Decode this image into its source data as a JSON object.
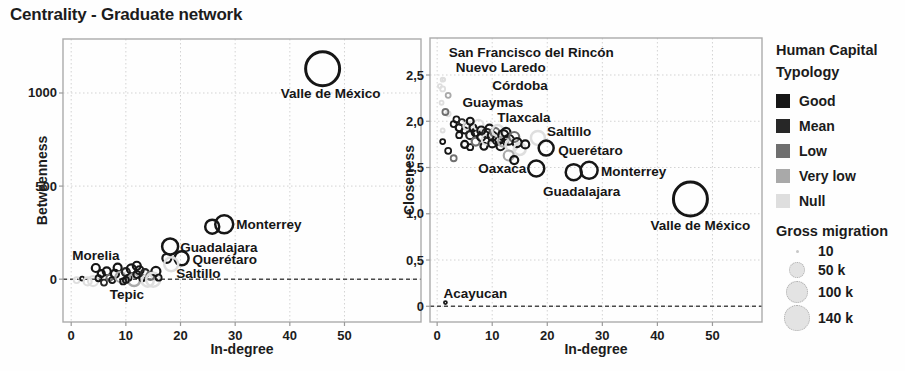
{
  "title": "Centrality - Graduate network",
  "legend": {
    "typology": {
      "title": "Human Capital Typology",
      "items": [
        {
          "label": "Good",
          "color": "#161616"
        },
        {
          "label": "Mean",
          "color": "#272727"
        },
        {
          "label": "Low",
          "color": "#6f6f6f"
        },
        {
          "label": "Very low",
          "color": "#a9a9a9"
        },
        {
          "label": "Null",
          "color": "#dedede"
        }
      ]
    },
    "size": {
      "title": "Gross migration",
      "items": [
        {
          "label": "10",
          "r": 1.5
        },
        {
          "label": "50 k",
          "r": 8
        },
        {
          "label": "100 k",
          "r": 11
        },
        {
          "label": "140 k",
          "r": 13
        }
      ]
    }
  },
  "chart_data": [
    {
      "type": "scatter",
      "xlabel": "In-degree",
      "ylabel": "Betweenness",
      "xlim": [
        -1.5,
        64
      ],
      "ylim": [
        -230,
        1290
      ],
      "xticks": [
        {
          "v": 0,
          "label": "0"
        },
        {
          "v": 10,
          "label": "10"
        },
        {
          "v": 20,
          "label": "20"
        },
        {
          "v": 30,
          "label": "30"
        },
        {
          "v": 40,
          "label": "40"
        },
        {
          "v": 50,
          "label": "50"
        }
      ],
      "yticks": [
        {
          "v": 0,
          "label": "0"
        },
        {
          "v": 500,
          "label": "500"
        },
        {
          "v": 1000,
          "label": "1000"
        }
      ],
      "zero_line_y": 0,
      "labeled_points": [
        {
          "city": "Valle de México",
          "x": 46,
          "y": 1130,
          "t": 0,
          "r": 17,
          "dx": 8,
          "dy": 25,
          "anchor": "middle"
        },
        {
          "city": "Monterrey",
          "x": 28,
          "y": 295,
          "t": 0,
          "r": 9,
          "dx": 12,
          "dy": 0,
          "anchor": "start"
        },
        {
          "city": "Guadalajara",
          "x": 18.1,
          "y": 176,
          "t": 0,
          "r": 8,
          "dx": 10,
          "dy": 1,
          "anchor": "start"
        },
        {
          "city": "Querétaro",
          "x": 20.2,
          "y": 112,
          "t": 0,
          "r": 7,
          "dx": 11,
          "dy": 1,
          "anchor": "start"
        },
        {
          "city": "Saltillo",
          "x": 18.3,
          "y": 80,
          "t": 4,
          "r": 7,
          "dx": 5,
          "dy": 9,
          "anchor": "start"
        },
        {
          "city": "Morelia",
          "x": 4.5,
          "y": 60,
          "t": 0,
          "r": 4,
          "dx": 0,
          "dy": -13,
          "anchor": "middle"
        },
        {
          "city": "Tepic",
          "x": 10,
          "y": -4,
          "t": 0,
          "r": 3,
          "dx": 1,
          "dy": 15,
          "anchor": "middle"
        }
      ],
      "points": [
        [
          25.8,
          282,
          0,
          7
        ],
        [
          17.5,
          112,
          0,
          4.5
        ],
        [
          1,
          -5,
          4,
          3
        ],
        [
          2,
          3,
          0,
          2
        ],
        [
          3,
          -12,
          4,
          4
        ],
        [
          4,
          -10,
          4,
          5
        ],
        [
          5,
          5,
          0,
          3
        ],
        [
          5.5,
          30,
          0,
          3.5
        ],
        [
          6,
          -18,
          1,
          3
        ],
        [
          6.5,
          42,
          0,
          4
        ],
        [
          7,
          8,
          2,
          3
        ],
        [
          7.5,
          -5,
          0,
          3
        ],
        [
          8,
          28,
          0,
          4
        ],
        [
          8.5,
          62,
          0,
          4
        ],
        [
          9,
          12,
          3,
          5
        ],
        [
          9.5,
          -12,
          0,
          3
        ],
        [
          10,
          38,
          1,
          4
        ],
        [
          10.5,
          8,
          0,
          3
        ],
        [
          11,
          55,
          0,
          4.5
        ],
        [
          11.5,
          -5,
          3,
          6
        ],
        [
          12,
          25,
          0,
          3.5
        ],
        [
          12.5,
          48,
          0,
          4
        ],
        [
          13,
          5,
          0,
          3
        ],
        [
          13.5,
          32,
          1,
          4
        ],
        [
          14,
          -8,
          4,
          6
        ],
        [
          14.5,
          18,
          2,
          4
        ],
        [
          15.5,
          42,
          0,
          4.5
        ],
        [
          15,
          -3,
          4,
          7
        ],
        [
          16,
          8,
          0,
          3
        ],
        [
          12,
          72,
          0,
          4
        ]
      ]
    },
    {
      "type": "scatter",
      "xlabel": "In-degree",
      "ylabel": "Closeness",
      "xlim": [
        -1.3,
        59
      ],
      "ylim": [
        -0.17,
        2.9
      ],
      "xticks": [
        {
          "v": 0,
          "label": "0"
        },
        {
          "v": 10,
          "label": "10"
        },
        {
          "v": 20,
          "label": "20"
        },
        {
          "v": 30,
          "label": "30"
        },
        {
          "v": 40,
          "label": "40"
        },
        {
          "v": 50,
          "label": "50"
        }
      ],
      "yticks": [
        {
          "v": 0,
          "label": "0"
        },
        {
          "v": 0.5,
          "label": "0,5"
        },
        {
          "v": 1,
          "label": "1,0"
        },
        {
          "v": 1.5,
          "label": "1,5"
        },
        {
          "v": 2,
          "label": "2,0"
        },
        {
          "v": 2.5,
          "label": "2,5"
        }
      ],
      "zero_line_y": 0,
      "labeled_points": [
        {
          "city": "San Francisco del Rincón",
          "x": 1,
          "y": 2.45,
          "t": 4,
          "r": 2,
          "dx": 6,
          "dy": -27,
          "anchor": "start"
        },
        {
          "city": "Nuevo Laredo",
          "x": 1,
          "y": 2.35,
          "t": 4,
          "r": 2.5,
          "dx": 13,
          "dy": -21,
          "anchor": "start"
        },
        {
          "city": "Córdoba",
          "x": 2,
          "y": 2.28,
          "t": 3,
          "r": 2.5,
          "dx": 44,
          "dy": -10,
          "anchor": "start"
        },
        {
          "city": "Guaymas",
          "x": 1.5,
          "y": 2.1,
          "t": 2,
          "r": 3,
          "dx": 17,
          "dy": -10,
          "anchor": "start"
        },
        {
          "city": "Tlaxcala",
          "x": 6,
          "y": 2.0,
          "t": 0,
          "r": 3.5,
          "dx": 27,
          "dy": -4,
          "anchor": "start"
        },
        {
          "city": "Saltillo",
          "x": 18.3,
          "y": 1.82,
          "t": 4,
          "r": 7,
          "dx": 9,
          "dy": -6,
          "anchor": "start"
        },
        {
          "city": "Querétaro",
          "x": 19.8,
          "y": 1.71,
          "t": 0,
          "r": 7.5,
          "dx": 12,
          "dy": 2,
          "anchor": "start"
        },
        {
          "city": "Oaxaca",
          "x": 18,
          "y": 1.49,
          "t": 0,
          "r": 8,
          "dx": -10,
          "dy": 0,
          "anchor": "end"
        },
        {
          "city": "Guadalajara",
          "x": 24.8,
          "y": 1.45,
          "t": 0,
          "r": 8,
          "dx": 8,
          "dy": 19,
          "anchor": "middle"
        },
        {
          "city": "Monterrey",
          "x": 27.6,
          "y": 1.47,
          "t": 0,
          "r": 8.5,
          "dx": 12,
          "dy": 1,
          "anchor": "start"
        },
        {
          "city": "Valle de México",
          "x": 46,
          "y": 1.16,
          "t": 0,
          "r": 17,
          "dx": 10,
          "dy": 27,
          "anchor": "middle"
        },
        {
          "city": "Acayucan",
          "x": 1.5,
          "y": 0.04,
          "t": 0,
          "r": 1.5,
          "dx": -2,
          "dy": -9,
          "anchor": "start"
        }
      ],
      "points": [
        [
          0.5,
          2.38,
          4,
          2
        ],
        [
          1.2,
          2.45,
          4,
          1.5
        ],
        [
          0.8,
          2.2,
          4,
          2
        ],
        [
          2,
          2.08,
          4,
          2.5
        ],
        [
          1,
          1.9,
          4,
          2
        ],
        [
          3,
          1.97,
          0,
          3
        ],
        [
          3.5,
          2.02,
          0,
          3
        ],
        [
          4,
          1.93,
          0,
          3.5
        ],
        [
          4,
          1.85,
          0,
          3
        ],
        [
          4.5,
          1.99,
          1,
          3
        ],
        [
          5,
          1.9,
          0,
          3
        ],
        [
          5,
          1.75,
          0,
          3.5
        ],
        [
          5.5,
          1.95,
          4,
          4
        ],
        [
          6,
          1.85,
          1,
          4
        ],
        [
          6,
          1.72,
          0,
          3
        ],
        [
          6.5,
          1.93,
          0,
          3.5
        ],
        [
          7,
          1.88,
          0,
          4
        ],
        [
          7,
          1.78,
          2,
          4
        ],
        [
          7.5,
          1.96,
          4,
          5
        ],
        [
          8,
          1.83,
          0,
          4
        ],
        [
          8,
          1.9,
          0,
          4
        ],
        [
          8.5,
          1.73,
          0,
          3.5
        ],
        [
          9,
          1.87,
          1,
          4.5
        ],
        [
          9,
          1.8,
          4,
          5
        ],
        [
          9.5,
          1.92,
          0,
          4
        ],
        [
          10,
          1.84,
          0,
          4.5
        ],
        [
          10,
          1.76,
          0,
          4
        ],
        [
          10.5,
          1.88,
          2,
          4.5
        ],
        [
          11,
          1.8,
          0,
          5
        ],
        [
          11,
          1.9,
          4,
          5.5
        ],
        [
          11.5,
          1.73,
          0,
          4
        ],
        [
          12,
          1.85,
          0,
          5
        ],
        [
          12,
          1.78,
          3,
          5
        ],
        [
          12.5,
          1.88,
          0,
          4.5
        ],
        [
          13,
          1.8,
          0,
          5
        ],
        [
          13.5,
          1.74,
          4,
          6
        ],
        [
          14,
          1.83,
          2,
          5
        ],
        [
          14.5,
          1.77,
          0,
          4.5
        ],
        [
          15,
          1.7,
          4,
          6
        ],
        [
          13,
          1.63,
          3,
          5
        ],
        [
          14,
          1.58,
          0,
          4
        ],
        [
          1,
          1.78,
          0,
          2.5
        ],
        [
          2,
          1.68,
          0,
          3
        ],
        [
          3,
          1.6,
          2,
          3
        ],
        [
          16,
          1.75,
          0,
          4
        ]
      ]
    }
  ]
}
